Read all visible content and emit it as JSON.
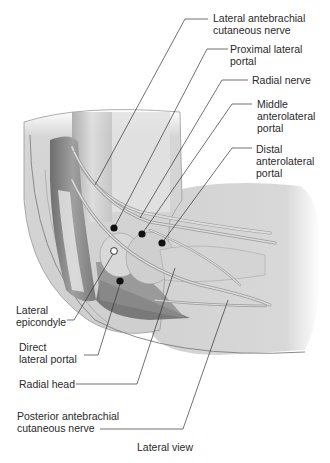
{
  "figure": {
    "caption": "Lateral view",
    "labels": {
      "lateral_antebrachial_cutaneous_nerve": "Lateral antebrachial\ncutaneous nerve",
      "proximal_lateral_portal": "Proximal lateral\nportal",
      "radial_nerve": "Radial nerve",
      "middle_anterolateral_portal": "Middle\nanterolateral\nportal",
      "distal_anterolateral_portal": "Distal\nanterolateral\nportal",
      "lateral_epicondyle": "Lateral\nepicondyle",
      "direct_lateral_portal": "Direct\nlateral portal",
      "radial_head": "Radial head",
      "posterior_antebrachial_cutaneous_nerve": "Posterior antebrachial\ncutaneous nerve"
    },
    "colors": {
      "skin": "#d9d9d9",
      "skin_edge": "#8a8a8a",
      "muscle": "#9a9a9a",
      "nerve": "#bdbdbd",
      "leader": "#333333",
      "portal_dot": "#111111"
    }
  }
}
